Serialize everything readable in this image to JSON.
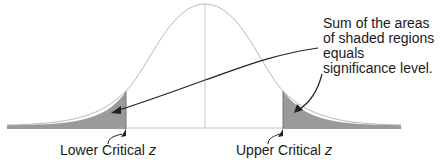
{
  "caption_cropped": "",
  "annotation": {
    "text": "Sum of the areas of shaded regions equals significance level."
  },
  "labels": {
    "lower": "Lower Critical ",
    "upper": "Upper Critical ",
    "z_symbol": "z"
  },
  "colors": {
    "curve": "#b8b8b8",
    "center_line": "#c8c8c8",
    "shaded": "#9a9a9a",
    "arrow": "#222222",
    "text": "#1a1a1a"
  },
  "geometry": {
    "baseline_y": 128,
    "center_x": 205,
    "peak_y": 4,
    "lower_critical_x": 126,
    "upper_critical_x": 283
  }
}
